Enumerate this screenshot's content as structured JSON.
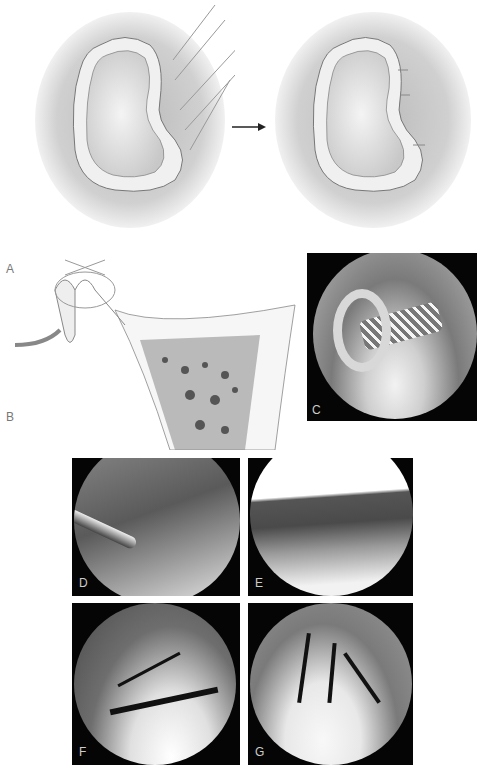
{
  "figure": {
    "top": {
      "left_illustration": "meniscus-with-sutures-before",
      "arrow": "→",
      "right_illustration": "meniscus-with-sutures-after"
    },
    "labels": {
      "A": "A",
      "B": "B",
      "C": "C",
      "D": "D",
      "E": "E",
      "F": "F",
      "G": "G"
    }
  }
}
